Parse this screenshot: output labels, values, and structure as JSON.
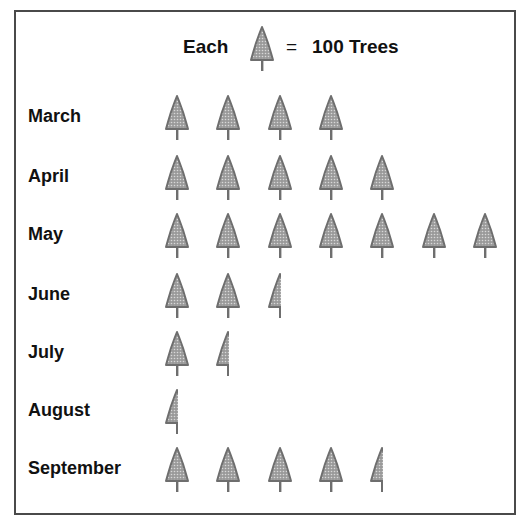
{
  "legend": {
    "prefix": "Each",
    "equals": "=",
    "value_label": "100 Trees",
    "icon": "tree-icon",
    "unit_value": 100
  },
  "colors": {
    "tree_fill": "#9a9a9a",
    "tree_stroke": "#6e6e6e",
    "frame": "#4a4a4a",
    "text": "#111111"
  },
  "chart_data": {
    "type": "pictograph",
    "unit": "trees",
    "icon_value": 100,
    "categories": [
      "March",
      "April",
      "May",
      "June",
      "July",
      "August",
      "September"
    ],
    "icons": [
      4,
      5,
      7,
      2.5,
      1.5,
      0.5,
      4.5
    ],
    "values": [
      400,
      500,
      700,
      250,
      150,
      50,
      450
    ]
  },
  "rows": [
    {
      "label": "March",
      "icons": 4
    },
    {
      "label": "April",
      "icons": 5
    },
    {
      "label": "May",
      "icons": 7
    },
    {
      "label": "June",
      "icons": 2.5
    },
    {
      "label": "July",
      "icons": 1.5
    },
    {
      "label": "August",
      "icons": 0.5
    },
    {
      "label": "September",
      "icons": 4.5
    }
  ]
}
